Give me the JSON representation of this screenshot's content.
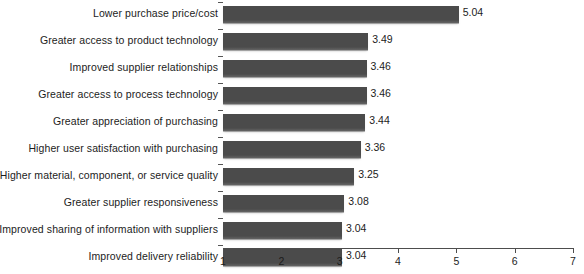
{
  "chart_data": {
    "type": "bar",
    "orientation": "horizontal",
    "title": "",
    "subtitle": "",
    "xlabel": "",
    "ylabel": "",
    "xlim": [
      1,
      7
    ],
    "xticks": [
      "1",
      "2",
      "3",
      "4",
      "5",
      "6",
      "7"
    ],
    "grid": false,
    "legend": null,
    "bar_color": "#4b4b4b",
    "categories": [
      "Lower purchase price/cost",
      "Greater access to product technology",
      "Improved supplier relationships",
      "Greater access to process technology",
      "Greater appreciation of purchasing",
      "Higher user satisfaction with purchasing",
      "Higher material, component, or service quality",
      "Greater supplier responsiveness",
      "Improved sharing of information with suppliers",
      "Improved delivery reliability"
    ],
    "values": [
      5.04,
      3.49,
      3.46,
      3.46,
      3.44,
      3.36,
      3.25,
      3.08,
      3.04,
      3.04
    ],
    "value_labels": [
      "5.04",
      "3.49",
      "3.46",
      "3.46",
      "3.44",
      "3.36",
      "3.25",
      "3.08",
      "3.04",
      "3.04"
    ]
  }
}
